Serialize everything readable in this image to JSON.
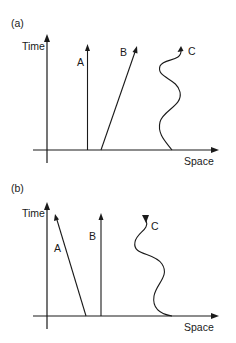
{
  "figure": {
    "panels": [
      {
        "id": "a",
        "label": "(a)",
        "y_axis_label": "Time",
        "x_axis_label": "Space",
        "worldlines": [
          {
            "name": "A",
            "label": "A",
            "description": "vertical line (at rest)"
          },
          {
            "name": "B",
            "label": "B",
            "description": "straight line tilted right (constant velocity)"
          },
          {
            "name": "C",
            "label": "C",
            "description": "wavy line upward (oscillating motion)"
          }
        ]
      },
      {
        "id": "b",
        "label": "(b)",
        "y_axis_label": "Time",
        "x_axis_label": "Space",
        "worldlines": [
          {
            "name": "A",
            "label": "A",
            "description": "straight line tilted left (constant velocity toward origin)"
          },
          {
            "name": "B",
            "label": "B",
            "description": "vertical line (at rest)"
          },
          {
            "name": "C",
            "label": "C",
            "description": "wavy line with arrow pointing downward"
          }
        ]
      }
    ]
  }
}
